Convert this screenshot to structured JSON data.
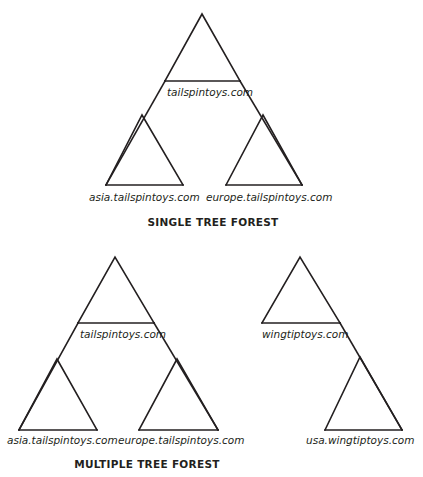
{
  "page": {
    "background_color": "#ffffff",
    "line_color": "#231f20",
    "text_color": "#231f20",
    "width": 423,
    "height": 477
  },
  "figures": [
    {
      "id": "single-tree-forest",
      "caption": "SINGLE TREE FOREST",
      "caption_x": 213,
      "caption_y": 226,
      "trees": [
        {
          "id": "tailspintoys-tree",
          "root": {
            "label": "tailspintoys.com",
            "label_x": 167,
            "label_y": 96,
            "apex": [
              202,
              14
            ],
            "left_base": [
              165,
              81
            ],
            "right_base": [
              240,
              81
            ],
            "skirt_left": [
              106,
              185
            ],
            "skirt_right": [
              302,
              185
            ]
          },
          "children": [
            {
              "label": "asia.tailspintoys.com",
              "label_x": 89,
              "label_y": 201,
              "apex": [
                142,
                115
              ],
              "left_base": [
                106,
                185
              ],
              "right_base": [
                183,
                185
              ]
            },
            {
              "label": "europe.tailspintoys.com",
              "label_x": 206,
              "label_y": 201,
              "apex": [
                263,
                115
              ],
              "left_base": [
                226,
                185
              ],
              "right_base": [
                302,
                185
              ]
            }
          ]
        }
      ]
    },
    {
      "id": "multiple-tree-forest",
      "caption": "MULTIPLE TREE FOREST",
      "caption_x": 147,
      "caption_y": 468,
      "trees": [
        {
          "id": "tailspintoys-tree-2",
          "root": {
            "label": "tailspintoys.com",
            "label_x": 80,
            "label_y": 338,
            "apex": [
              115,
              257
            ],
            "left_base": [
              78,
              323
            ],
            "right_base": [
              154,
              323
            ],
            "skirt_left": [
              19,
              430
            ],
            "skirt_right": [
              218,
              430
            ]
          },
          "children": [
            {
              "label": "asia.tailspintoys.com",
              "label_x": 7,
              "label_y": 444,
              "apex": [
                57,
                359
              ],
              "left_base": [
                19,
                430
              ],
              "right_base": [
                97,
                430
              ]
            },
            {
              "label": "europe.tailspintoys.com",
              "label_x": 118,
              "label_y": 444,
              "apex": [
                177,
                359
              ],
              "left_base": [
                139,
                430
              ],
              "right_base": [
                218,
                430
              ]
            }
          ]
        },
        {
          "id": "wingtiptoys-tree",
          "root": {
            "label": "wingtiptoys.com",
            "label_x": 262,
            "label_y": 338,
            "apex": [
              300,
              257
            ],
            "left_base": [
              262,
              323
            ],
            "right_base": [
              340,
              323
            ],
            "skirt_left": null,
            "skirt_right": [
              402,
              430
            ]
          },
          "children": [
            {
              "label": "usa.wingtiptoys.com",
              "label_x": 306,
              "label_y": 444,
              "apex": [
                360,
                357
              ],
              "left_base": [
                325,
                430
              ],
              "right_base": [
                402,
                430
              ]
            }
          ]
        }
      ]
    }
  ]
}
